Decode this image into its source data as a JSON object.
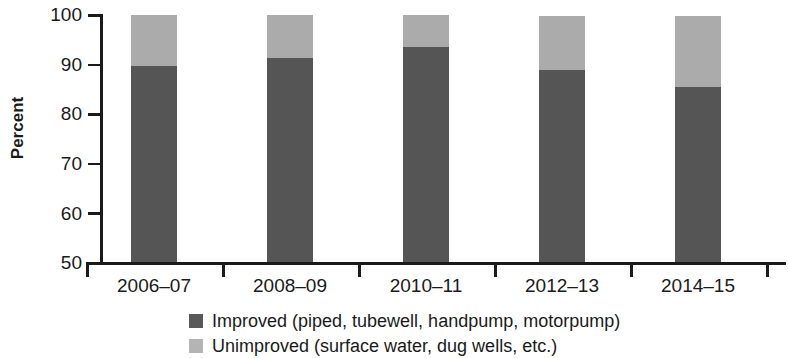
{
  "chart_data": {
    "type": "bar",
    "subtype": "stacked-bar",
    "title": "",
    "xlabel": "",
    "ylabel": "Percent",
    "ylim": [
      50,
      100
    ],
    "yticks": [
      50,
      60,
      70,
      80,
      90,
      100
    ],
    "grid": false,
    "legend_position": "bottom",
    "categories": [
      "2006–07",
      "2008–09",
      "2010–11",
      "2012–13",
      "2014–15"
    ],
    "series": [
      {
        "name": "Improved (piped, tubewell, handpump, motorpump)",
        "color": "#555555",
        "values": [
          89.6,
          91.4,
          93.6,
          88.8,
          85.5
        ]
      },
      {
        "name": "Unimproved (surface water, dug wells, etc.)",
        "color": "#ababab",
        "values": [
          10.4,
          8.6,
          6.4,
          11.0,
          14.2
        ]
      }
    ],
    "bar_tops": [
      100.0,
      100.0,
      100.0,
      99.8,
      99.7
    ]
  },
  "axis": {
    "y_title": "Percent",
    "y_tick_labels": [
      "100",
      "90",
      "80",
      "70",
      "60",
      "50"
    ],
    "x_tick_labels": [
      "2006–07",
      "2008–09",
      "2010–11",
      "2012–13",
      "2014–15"
    ]
  },
  "legend": {
    "items": [
      {
        "label": "Improved (piped, tubewell, handpump, motorpump)",
        "swatch": "dark-gray-swatch"
      },
      {
        "label": "Unimproved (surface water, dug wells, etc.)",
        "swatch": "light-gray-swatch"
      }
    ]
  },
  "colors": {
    "improved": "#555555",
    "unimproved": "#ababab",
    "axis": "#1a1a1a",
    "background": "#ffffff"
  }
}
